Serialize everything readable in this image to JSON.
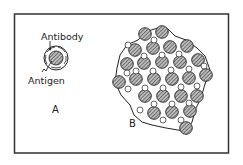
{
  "figure": {
    "panel_a": {
      "label": "A",
      "annotations": {
        "antibody": "Antibody",
        "antigen": "Antigen"
      }
    },
    "panel_b": {
      "label": "B"
    }
  },
  "colors": {
    "stroke": "#222222",
    "background": "#ffffff"
  }
}
